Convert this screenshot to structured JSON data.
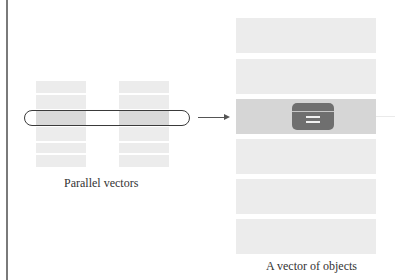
{
  "diagram": {
    "left_panel": {
      "caption": "Parallel vectors",
      "vectors": [
        {
          "name": "vector-a",
          "rows": 6,
          "highlighted_row": 2
        },
        {
          "name": "vector-b",
          "rows": 6,
          "highlighted_row": 2
        }
      ],
      "selection": "capsule spanning highlighted row across both vectors"
    },
    "arrow": {
      "direction": "right"
    },
    "right_panel": {
      "caption": "A vector of objects",
      "rows": 6,
      "highlighted_row": 2,
      "highlighted_icon": "object-card-icon"
    },
    "colors": {
      "row_fill": "#ececec",
      "row_highlight": "#d6d6d6",
      "object_icon": "#6f6f6f",
      "outline": "#3a3a3a",
      "border": "#7a7a7a"
    }
  }
}
